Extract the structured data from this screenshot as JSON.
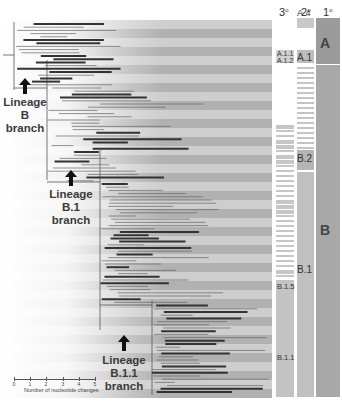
{
  "figure": {
    "type": "phylogenetic-tree",
    "background": "#ffffff",
    "band_color_light": "#c9c9c9",
    "band_color_dark": "#a8a8a8",
    "branch_color": "#555555",
    "highlight_branch_color": "#3a3a3a"
  },
  "columns": {
    "tertiary": {
      "label": "3°",
      "base": "3",
      "sup": "o"
    },
    "secondary": {
      "label": "2°",
      "base": "2",
      "sup": "o"
    },
    "primary": {
      "label": "1°",
      "base": "1",
      "sup": "o"
    }
  },
  "primary_clades": [
    {
      "label": "A",
      "y_start": 8,
      "y_end": 63,
      "color": "#9e9e9e"
    },
    {
      "label": "B",
      "y_start": 64,
      "y_end": 397,
      "color": "#a9a9a9"
    }
  ],
  "secondary_clades": [
    {
      "label": "A.4",
      "y_start": 8,
      "y_end": 18
    },
    {
      "label": "A.1",
      "y_start": 50,
      "y_end": 63
    },
    {
      "label": "B.2",
      "y_start": 150,
      "y_end": 170
    },
    {
      "label": "B.1",
      "y_start": 171,
      "y_end": 397
    }
  ],
  "tertiary_clades": [
    {
      "label": "A.1.1",
      "y": 54
    },
    {
      "label": "A.1.2",
      "y": 60
    },
    {
      "label": "B.1.5",
      "y": 285
    },
    {
      "label": "B.1.1",
      "y": 355
    }
  ],
  "lineage_annotations": [
    {
      "lines": [
        "Lineage",
        "B",
        "branch"
      ],
      "x": 25,
      "y": 95
    },
    {
      "lines": [
        "Lineage",
        "B.1",
        "branch"
      ],
      "x": 72,
      "y": 173
    },
    {
      "lines": [
        "Lineage",
        "B.1.1",
        "branch"
      ],
      "x": 142,
      "y": 335
    }
  ],
  "scale_bar": {
    "title": "Number of nucleotide changes",
    "ticks": [
      "0",
      "1",
      "2",
      "3",
      "4",
      "5"
    ]
  }
}
